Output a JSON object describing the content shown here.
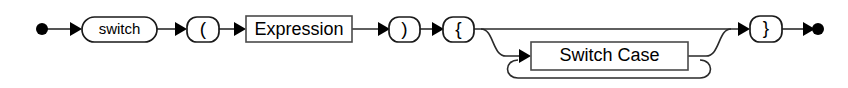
{
  "diagram": {
    "kind": "railroad-syntax-diagram",
    "background_color": "#ffffff",
    "line_color": "#2a2a2a",
    "text_color": "#000000",
    "start_marker": "filled-circle",
    "end_marker": "filled-circle",
    "nodes": [
      {
        "id": "start",
        "type": "start-point",
        "label": ""
      },
      {
        "id": "switch-keyword",
        "type": "terminal",
        "shape": "capsule",
        "label": "switch"
      },
      {
        "id": "open-paren",
        "type": "terminal",
        "shape": "capsule",
        "label": "("
      },
      {
        "id": "expression",
        "type": "nonterminal",
        "shape": "rectangle",
        "label": "Expression"
      },
      {
        "id": "close-paren",
        "type": "terminal",
        "shape": "capsule",
        "label": ")"
      },
      {
        "id": "open-brace",
        "type": "terminal",
        "shape": "capsule",
        "label": "{"
      },
      {
        "id": "switch-case",
        "type": "nonterminal",
        "shape": "rectangle",
        "label": "Switch Case"
      },
      {
        "id": "close-brace",
        "type": "terminal",
        "shape": "capsule",
        "label": "}"
      },
      {
        "id": "end",
        "type": "end-point",
        "label": ""
      }
    ],
    "branches": [
      {
        "id": "bypass-branch",
        "description": "straight path skipping Switch Case"
      },
      {
        "id": "switch-case-branch",
        "description": "path through Switch Case"
      },
      {
        "id": "repeat-loop",
        "description": "loop back allowing repeated Switch Case"
      }
    ]
  }
}
